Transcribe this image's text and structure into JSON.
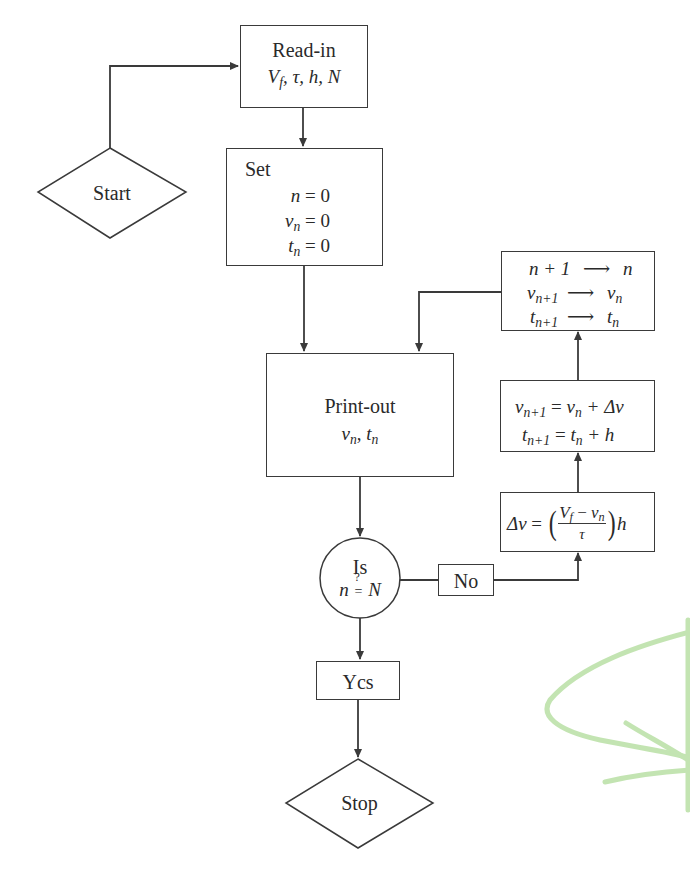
{
  "flowchart": {
    "start": {
      "label": "Start"
    },
    "read_in": {
      "title": "Read-in",
      "params": "V_f, τ, h, N",
      "params_parts": {
        "V": "V",
        "f": "f",
        "rest": ", τ, h, N"
      }
    },
    "set": {
      "title": "Set",
      "lines": [
        "n = 0",
        "v_n = 0",
        "t_n = 0"
      ],
      "parts": {
        "n_lhs": "n",
        "v_lhs": "v",
        "t_lhs": "t",
        "sub_n": "n",
        "rhs": " = 0"
      }
    },
    "print_out": {
      "title": "Print-out",
      "values": "v_n, t_n",
      "parts": {
        "v": "v",
        "t": "t",
        "sub": "n",
        "sep": ", "
      }
    },
    "decision": {
      "title": "Is",
      "condition": "n ?= N",
      "parts": {
        "lhs": "n",
        "q": "?",
        "eq": "=",
        "rhs": "N"
      }
    },
    "no_label": "No",
    "yes_label": "Ycs",
    "stop": {
      "label": "Stop"
    },
    "delta_v": {
      "formula": "Δv = ((V_f − v_n)/τ) h",
      "parts": {
        "lhs": "Δv",
        "eq": " = ",
        "lparen": "(",
        "rparen": ")",
        "num_V": "V",
        "num_f": "f",
        "num_minus": " − ",
        "num_v": "v",
        "num_n": "n",
        "den": "τ",
        "h": "h"
      }
    },
    "update": {
      "lines": [
        "v_{n+1} = v_n + Δv",
        "t_{n+1} = t_n + h"
      ],
      "parts": {
        "v": "v",
        "t": "t",
        "sub_n1": "n+1",
        "sub_n": "n",
        "eq": " = ",
        "plus_dv": " + Δv",
        "plus_h": " + h"
      }
    },
    "increment": {
      "lines": [
        "n+1 → n",
        "v_{n+1} → v_n",
        "t_{n+1} → t_n"
      ],
      "parts": {
        "n_lhs": "n + 1",
        "n_rhs": "n",
        "v": "v",
        "t": "t",
        "sub_n1": "n+1",
        "sub_n": "n",
        "arrow": "⟶"
      }
    }
  },
  "colors": {
    "ink": "#3a3a3a",
    "background": "#ffffff",
    "highlighter_stroke": "#b9e0a5"
  }
}
